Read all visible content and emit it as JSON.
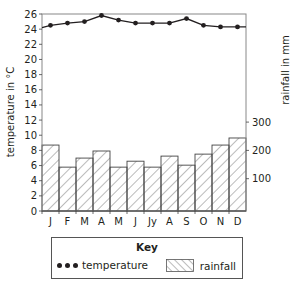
{
  "chart_data": {
    "type": "bar+line",
    "title": "",
    "categories": [
      "J",
      "F",
      "M",
      "A",
      "M",
      "J",
      "Jy",
      "A",
      "S",
      "O",
      "N",
      "D"
    ],
    "series": [
      {
        "name": "temperature",
        "type": "line",
        "axis": "left",
        "unit": "°C",
        "values": [
          24.5,
          24.8,
          25.0,
          25.8,
          25.2,
          24.8,
          24.8,
          24.8,
          25.4,
          24.5,
          24.3,
          24.3
        ]
      },
      {
        "name": "rainfall",
        "type": "bar",
        "axis": "right",
        "unit": "mm",
        "values": [
          233,
          155,
          187,
          212,
          155,
          176,
          155,
          194,
          162,
          201,
          233,
          258
        ]
      }
    ],
    "left_axis": {
      "label": "temperature in °C",
      "range": [
        0,
        26
      ],
      "ticks": [
        0,
        2,
        4,
        6,
        8,
        10,
        12,
        14,
        16,
        18,
        20,
        22,
        24,
        26
      ]
    },
    "right_axis": {
      "label": "rainfall in mm",
      "ticks": [
        100,
        200,
        300
      ]
    },
    "xlabel": "",
    "grid": false,
    "legend": {
      "title": "Key",
      "position": "bottom",
      "entries": [
        "temperature",
        "rainfall"
      ]
    }
  },
  "axes": {
    "left_label": "temperature in °C",
    "right_label": "rainfall in mm"
  },
  "key": {
    "title": "Key",
    "temperature_label": "temperature",
    "rainfall_label": "rainfall"
  }
}
